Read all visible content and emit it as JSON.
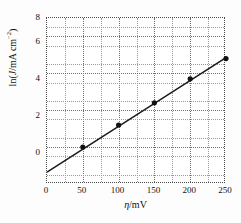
{
  "chart_data": {
    "type": "scatter",
    "title": "",
    "subtitle": "",
    "xlabel": "η/mV",
    "ylabel": "ln(J/mA cm⁻²)",
    "xlim": [
      0,
      250
    ],
    "ylim": [
      -1,
      8
    ],
    "xticks": [
      0,
      50,
      100,
      150,
      200,
      250
    ],
    "yticks": [
      0,
      2,
      4,
      6,
      8
    ],
    "x_minor_step": 25,
    "y_minor_step": 1,
    "grid": true,
    "legend": "none",
    "marker": "filled-circle",
    "marker_color": "#111111",
    "line_color": "#1a1a1a",
    "series": [
      {
        "name": "ln(J) vs eta",
        "x": [
          50,
          100,
          150,
          200,
          250
        ],
        "values": [
          1.0,
          2.2,
          3.4,
          4.7,
          5.8
        ]
      }
    ],
    "fit_line": {
      "x": [
        0,
        250
      ],
      "values": [
        -0.35,
        5.85
      ]
    }
  },
  "axes": {
    "x_tick_labels": [
      "0",
      "50",
      "100",
      "150",
      "200",
      "250"
    ],
    "y_tick_labels": [
      "0",
      "2",
      "4",
      "6",
      "8"
    ],
    "x_title_symbol": "η",
    "x_title_unit": "/mV",
    "y_title_prefix": "ln(",
    "y_title_var": "J",
    "y_title_unit": "/mA cm",
    "y_title_exponent": "−2",
    "y_title_suffix": ")"
  },
  "colors": {
    "marker": "#111111",
    "line": "#1a1a1a",
    "grid_major": "#6f6f6f",
    "grid_minor": "#9a9a9a",
    "frame": "#4a4a4a",
    "background": "#ffffff",
    "canvas": "#fdfdfd"
  }
}
